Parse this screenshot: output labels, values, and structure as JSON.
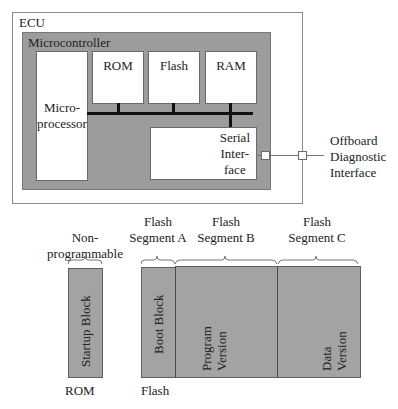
{
  "ecu": {
    "label": "ECU",
    "microcontroller": {
      "label": "Microcontroller",
      "microprocessor": {
        "line1": "Micro-",
        "line2": "processor"
      },
      "memories": [
        {
          "id": "rom",
          "label": "ROM"
        },
        {
          "id": "flash",
          "label": "Flash"
        },
        {
          "id": "ram",
          "label": "RAM"
        }
      ],
      "serial_interface": {
        "line1": "Serial",
        "line2": "Inter-",
        "line3": "face"
      }
    }
  },
  "offboard": {
    "line1": "Offboard",
    "line2": "Diagnostic",
    "line3": "Interface"
  },
  "memory_layout": {
    "rom": {
      "group_line1": "Non-",
      "group_line2": "programmable",
      "block": "Startup Block",
      "footer": "ROM"
    },
    "flash": {
      "footer": "Flash",
      "segments": [
        {
          "title_line1": "Flash",
          "title_line2": "Segment A",
          "block_line1": "Boot Block",
          "block_line2": ""
        },
        {
          "title_line1": "Flash",
          "title_line2": "Segment B",
          "block_line1": "Program",
          "block_line2": "Version"
        },
        {
          "title_line1": "Flash",
          "title_line2": "Segment C",
          "block_line1": "Data",
          "block_line2": "Version"
        }
      ]
    }
  },
  "colors": {
    "block_fill": "#a3a3a3",
    "microcontroller_fill": "#9c9c9c",
    "bus": "#111111"
  }
}
